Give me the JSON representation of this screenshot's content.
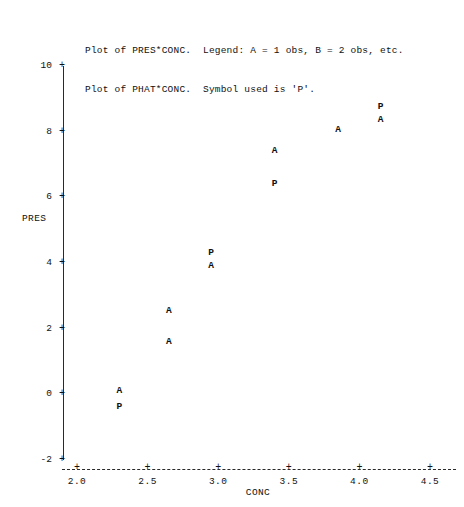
{
  "header": {
    "lines": [
      "Plot of PRES*CONC.  Legend: A = 1 obs, B = 2 obs, etc.",
      "Plot of PHAT*CONC.  Symbol used is 'P'."
    ]
  },
  "chart_data": {
    "type": "scatter",
    "title": "Plot of PRES*CONC.  Legend: A = 1 obs, B = 2 obs, etc.",
    "subtitle": "Plot of PHAT*CONC.  Symbol used is 'P'.",
    "xlabel": "CONC",
    "ylabel": "PRES",
    "xlim": [
      2.0,
      4.5
    ],
    "ylim": [
      -2,
      10
    ],
    "xticks": [
      "2.0",
      "2.5",
      "3.0",
      "3.5",
      "4.0",
      "4.5"
    ],
    "xtick_values": [
      2.0,
      2.5,
      3.0,
      3.5,
      4.0,
      4.5
    ],
    "yticks": [
      "10",
      "8",
      "6",
      "4",
      "2",
      "0",
      "-2"
    ],
    "ytick_values": [
      10,
      8,
      6,
      4,
      2,
      0,
      -2
    ],
    "grid": false,
    "legend": [
      "A = 1 obs",
      "B = 2 obs",
      "P = PHAT predicted"
    ],
    "tick_glyph": "+",
    "xaxis_style": "dashed",
    "yaxis_style": "solid",
    "series": [
      {
        "name": "PRES*CONC",
        "symbol": "A",
        "x": [
          2.3,
          2.65,
          2.65,
          2.95,
          3.4,
          3.85,
          4.15
        ],
        "y": [
          0.1,
          2.55,
          1.6,
          3.9,
          7.4,
          8.05,
          8.35
        ]
      },
      {
        "name": "PHAT*CONC",
        "symbol": "P",
        "x": [
          2.3,
          2.95,
          3.4,
          4.15
        ],
        "y": [
          -0.4,
          4.3,
          6.4,
          8.75
        ]
      }
    ],
    "points": [
      {
        "symbol": "A",
        "x": 2.3,
        "y": 0.1
      },
      {
        "symbol": "P",
        "x": 2.3,
        "y": -0.4
      },
      {
        "symbol": "A",
        "x": 2.65,
        "y": 2.55
      },
      {
        "symbol": "A",
        "x": 2.65,
        "y": 1.6
      },
      {
        "symbol": "P",
        "x": 2.95,
        "y": 4.3
      },
      {
        "symbol": "A",
        "x": 2.95,
        "y": 3.9
      },
      {
        "symbol": "A",
        "x": 3.4,
        "y": 7.4
      },
      {
        "symbol": "P",
        "x": 3.4,
        "y": 6.4
      },
      {
        "symbol": "A",
        "x": 3.85,
        "y": 8.05
      },
      {
        "symbol": "P",
        "x": 4.15,
        "y": 8.75
      },
      {
        "symbol": "A",
        "x": 4.15,
        "y": 8.35
      }
    ]
  }
}
